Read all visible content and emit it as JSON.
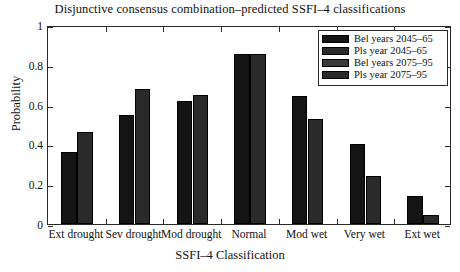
{
  "chart_data": {
    "type": "bar",
    "title": "Disjunctive consensus combination–predicted SSFI–4 classifications",
    "xlabel": "SSFI–4 Classification",
    "ylabel": "Probability",
    "categories": [
      "Ext drought",
      "Sev drought",
      "Mod drought",
      "Normal",
      "Mod wet",
      "Very wet",
      "Ext wet"
    ],
    "series": [
      {
        "name": "Bel years 2045–65",
        "values": [
          0.36,
          0.55,
          0.62,
          0.855,
          0.645,
          0.4,
          0.14
        ]
      },
      {
        "name": "Pls year 2045–65",
        "values": [
          0.36,
          0.55,
          0.62,
          0.855,
          0.645,
          0.4,
          0.14
        ]
      },
      {
        "name": "Bel years 2075–95",
        "values": [
          0.46,
          0.68,
          0.65,
          0.855,
          0.53,
          0.24,
          0.045
        ]
      },
      {
        "name": "Pls year 2075–95",
        "values": [
          0.46,
          0.68,
          0.65,
          0.855,
          0.53,
          0.24,
          0.045
        ]
      }
    ],
    "ylim": [
      0,
      1
    ],
    "yticks": [
      "0",
      "0.2",
      "0.4",
      "0.6",
      "0.8",
      "1"
    ],
    "ytick_values": [
      0,
      0.2,
      0.4,
      0.6,
      0.8,
      1
    ],
    "grid": false,
    "legend_position": "top-right"
  },
  "legend": {
    "entries": [
      {
        "label": "Bel years 2045–65",
        "color": "#141414"
      },
      {
        "label": "Pls year 2045–65",
        "color": "#2a2a2a"
      },
      {
        "label": "Bel years 2075–95",
        "color": "#3a3a3a"
      },
      {
        "label": "Pls year 2075–95",
        "color": "#2a2a2a"
      }
    ]
  },
  "colors": {
    "axis": "#2a2a2a",
    "text": "#111111",
    "background": "#ffffff",
    "bar_dark": "#141414",
    "bar_gray": "#2a2a2a"
  }
}
